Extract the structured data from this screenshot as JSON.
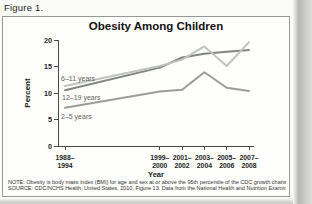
{
  "figure_label": "Figure 1.",
  "chart_data": {
    "type": "line",
    "title": "Obesity Among Children",
    "xlabel": "Year",
    "ylabel": "Percent",
    "ylim": [
      0,
      20
    ],
    "yticks": [
      0,
      5,
      10,
      15,
      20
    ],
    "grid": false,
    "legend_position": "inline-labels",
    "x_tick_labels": [
      [
        "1988–",
        "1994"
      ],
      [
        "1999–",
        "2000"
      ],
      [
        "2001–",
        "2002"
      ],
      [
        "2003–",
        "2004"
      ],
      [
        "2005–",
        "2006"
      ],
      [
        "2007–",
        "2008"
      ]
    ],
    "x_years": [
      1991,
      1999.5,
      2001.5,
      2003.5,
      2005.5,
      2007.5
    ],
    "series": [
      {
        "name": "6–11 years",
        "values": [
          11.3,
          15.1,
          16.3,
          18.8,
          15.1,
          19.6
        ],
        "color": "#c0c4be"
      },
      {
        "name": "12–19 years",
        "values": [
          10.5,
          14.8,
          16.7,
          17.4,
          17.8,
          18.1
        ],
        "color": "#82857f"
      },
      {
        "name": "2–5 years",
        "values": [
          7.2,
          10.3,
          10.6,
          13.9,
          11.0,
          10.4
        ],
        "color": "#9b9e97"
      }
    ]
  },
  "footnotes": {
    "note": "NOTE: Obesity is body mass index (BMI) for age and sex at or above the 95th percentile of the CDC growth charts.",
    "source": "SOURCE: CDC/NCHS Health, United States, 2010, Figure 13. Data from the National Health and Nutrition Examination Survey."
  },
  "colors": {
    "axis": "#474747",
    "page_background": "#fbfbf8",
    "box_border": "#97979a"
  }
}
